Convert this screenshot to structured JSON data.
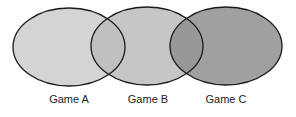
{
  "diagram": {
    "type": "venn",
    "sets": [
      {
        "label": "Game A",
        "fill": "#d2d2d2"
      },
      {
        "label": "Game B",
        "fill": "#bdbdbd"
      },
      {
        "label": "Game C",
        "fill": "#9a9a9a"
      }
    ]
  }
}
